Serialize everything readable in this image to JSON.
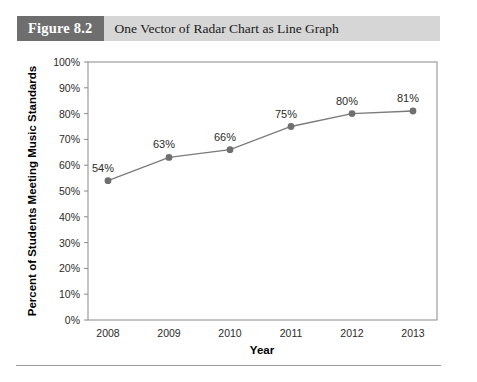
{
  "figure": {
    "number_label": "Figure 8.2",
    "title": "One Vector of Radar Chart as Line Graph"
  },
  "chart_data": {
    "type": "line",
    "title": "One Vector of Radar Chart as Line Graph",
    "categories": [
      "2008",
      "2009",
      "2010",
      "2011",
      "2012",
      "2013"
    ],
    "values": [
      54,
      63,
      66,
      75,
      80,
      81
    ],
    "point_labels": [
      "54%",
      "63%",
      "66%",
      "75%",
      "80%",
      "81%"
    ],
    "xlabel": "Year",
    "ylabel": "Percent of Students Meeting Music Standards",
    "ylim": [
      0,
      100
    ],
    "ytick_step": 10,
    "ytick_labels": [
      "0%",
      "10%",
      "20%",
      "30%",
      "40%",
      "50%",
      "60%",
      "70%",
      "80%",
      "90%",
      "100%"
    ],
    "grid": false,
    "legend": false,
    "series_color": "#7a7a7a",
    "marker_color": "#6f6f6f",
    "frame_color": "#8a8a8a"
  }
}
